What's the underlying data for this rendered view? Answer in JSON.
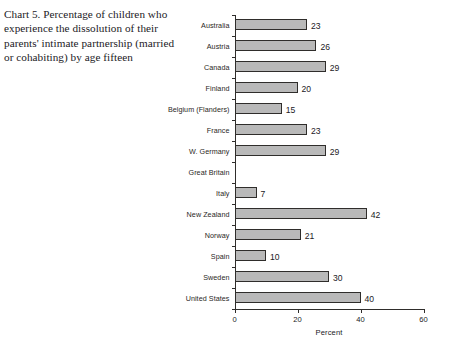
{
  "caption": {
    "text": "Chart 5. Percentage of children who experience the dissolution of their parents' intimate partnership (married or cohabiting) by age fifteen"
  },
  "chart_data": {
    "type": "bar",
    "orientation": "horizontal",
    "title": "",
    "xlabel": "Percent",
    "ylabel": "",
    "xlim": [
      0,
      60
    ],
    "xticks": [
      0,
      20,
      40,
      60
    ],
    "xtick_labels": [
      "0",
      "20",
      "40",
      "60"
    ],
    "grid": false,
    "legend": null,
    "categories": [
      "Australia",
      "Austria",
      "Canada",
      "Finland",
      "Belgium (Flanders)",
      "France",
      "W. Germany",
      "Great Britain",
      "Italy",
      "New Zealand",
      "Norway",
      "Spain",
      "Sweden",
      "United States"
    ],
    "values": [
      23,
      26,
      29,
      20,
      15,
      23,
      29,
      null,
      7,
      42,
      21,
      10,
      30,
      40
    ],
    "value_labels": [
      "23",
      "26",
      "29",
      "20",
      "15",
      "23",
      "29",
      "",
      "7",
      "42",
      "21",
      "10",
      "30",
      "40"
    ],
    "bar_fill_color": "#b9b9b9",
    "bar_edge_color": "#2f2d2b",
    "axis_color": "#2f2d2b"
  }
}
